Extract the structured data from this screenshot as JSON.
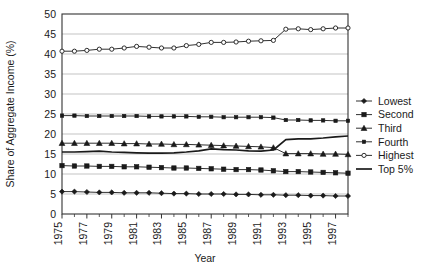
{
  "chart_data": {
    "type": "line",
    "title": "",
    "xlabel": "Year",
    "ylabel": "Share of Aggregate Income (%)",
    "xlim": [
      1975,
      1998
    ],
    "ylim": [
      0,
      50
    ],
    "ytick_values": [
      0,
      5,
      10,
      15,
      20,
      25,
      30,
      35,
      40,
      45,
      50
    ],
    "ytick_labels": [
      "0",
      "5",
      "10",
      "15",
      "20",
      "25",
      "30",
      "35",
      "40",
      "45",
      "50"
    ],
    "xtick_values": [
      1975,
      1977,
      1979,
      1981,
      1983,
      1985,
      1987,
      1989,
      1991,
      1993,
      1995,
      1997
    ],
    "xtick_labels": [
      "1975",
      "1977",
      "1979",
      "1981",
      "1983",
      "1985",
      "1987",
      "1989",
      "1991",
      "1993",
      "1995",
      "1997"
    ],
    "xtick_minor_values": [
      1976,
      1978,
      1980,
      1982,
      1984,
      1986,
      1988,
      1990,
      1992,
      1994,
      1996,
      1998
    ],
    "grid": "horizontal-major",
    "grid_color": "#b4b4b4",
    "frame_color": "#333333",
    "line_color": "#1a1a1a",
    "legend_position": "right",
    "x": [
      1975,
      1976,
      1977,
      1978,
      1979,
      1980,
      1981,
      1982,
      1983,
      1984,
      1985,
      1986,
      1987,
      1988,
      1989,
      1990,
      1991,
      1992,
      1993,
      1994,
      1995,
      1996,
      1997,
      1998
    ],
    "series": [
      {
        "name": "Lowest",
        "marker": "diamond",
        "values": [
          5.6,
          5.6,
          5.5,
          5.4,
          5.4,
          5.3,
          5.3,
          5.3,
          5.2,
          5.1,
          5.1,
          5.0,
          5.0,
          5.0,
          4.9,
          4.9,
          4.8,
          4.8,
          4.7,
          4.7,
          4.6,
          4.6,
          4.5,
          4.5
        ]
      },
      {
        "name": "Second",
        "marker": "square-filled",
        "values": [
          12.1,
          12.0,
          12.0,
          11.9,
          11.9,
          11.8,
          11.8,
          11.7,
          11.6,
          11.5,
          11.5,
          11.4,
          11.3,
          11.2,
          11.1,
          11.1,
          11.0,
          10.8,
          10.6,
          10.6,
          10.5,
          10.4,
          10.3,
          10.2
        ]
      },
      {
        "name": "Third",
        "marker": "triangle-filled",
        "values": [
          17.7,
          17.7,
          17.7,
          17.7,
          17.7,
          17.6,
          17.6,
          17.5,
          17.5,
          17.4,
          17.4,
          17.3,
          17.2,
          17.1,
          17.0,
          16.9,
          16.8,
          16.6,
          15.1,
          15.1,
          15.1,
          15.0,
          15.0,
          14.9
        ]
      },
      {
        "name": "Fourth",
        "marker": "square-small",
        "values": [
          24.6,
          24.6,
          24.5,
          24.5,
          24.5,
          24.5,
          24.5,
          24.4,
          24.4,
          24.4,
          24.4,
          24.3,
          24.3,
          24.2,
          24.2,
          24.2,
          24.2,
          24.1,
          23.5,
          23.5,
          23.4,
          23.4,
          23.3,
          23.3
        ]
      },
      {
        "name": "Highest",
        "marker": "circle-open",
        "values": [
          40.7,
          40.7,
          40.9,
          41.2,
          41.2,
          41.5,
          41.9,
          41.7,
          41.5,
          41.5,
          42.1,
          42.4,
          42.9,
          42.9,
          43.0,
          43.2,
          43.3,
          43.4,
          46.2,
          46.3,
          46.1,
          46.3,
          46.5,
          46.5
        ]
      },
      {
        "name": "Top 5%",
        "marker": "none",
        "values": [
          15.5,
          15.5,
          15.6,
          15.7,
          15.5,
          15.4,
          15.3,
          15.2,
          15.2,
          15.3,
          15.5,
          15.8,
          16.3,
          16.1,
          16.0,
          15.8,
          15.7,
          16.0,
          18.6,
          18.8,
          18.8,
          19.0,
          19.3,
          19.5
        ]
      }
    ]
  },
  "legend": {
    "entries": [
      {
        "label": "Lowest"
      },
      {
        "label": "Second"
      },
      {
        "label": "Third"
      },
      {
        "label": "Fourth"
      },
      {
        "label": "Highest"
      },
      {
        "label": "Top 5%"
      }
    ]
  }
}
